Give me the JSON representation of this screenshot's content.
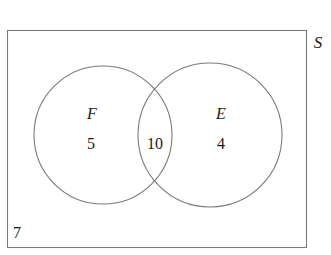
{
  "figure": {
    "type": "venn-diagram",
    "background_color": "#ffffff",
    "stroke_color": "#7a7a7a",
    "text_color": "#1a1a1a",
    "width": 331,
    "height": 255
  },
  "universe": {
    "label": "S",
    "label_position": {
      "x": 318,
      "y": 42
    },
    "outside_count": "7",
    "outside_count_position": {
      "x": 17,
      "y": 233
    },
    "rect": {
      "x": 7,
      "y": 30,
      "width": 300,
      "height": 218
    }
  },
  "sets": [
    {
      "name": "left-set",
      "label": "F",
      "label_position": {
        "x": 92,
        "y": 114
      },
      "count": "5",
      "count_position": {
        "x": 91,
        "y": 144
      },
      "circle": {
        "cx": 103,
        "cy": 135,
        "r": 69
      }
    },
    {
      "name": "right-set",
      "label": "E",
      "label_position": {
        "x": 221,
        "y": 114
      },
      "count": "4",
      "count_position": {
        "x": 221,
        "y": 144
      },
      "circle": {
        "cx": 210,
        "cy": 135,
        "r": 72
      }
    }
  ],
  "intersection": {
    "label": "",
    "count": "10",
    "count_position": {
      "x": 155,
      "y": 144
    }
  },
  "chart_data": {
    "type": "venn",
    "title": "",
    "universe_label": "S",
    "regions": [
      {
        "region": "F only",
        "label": "F",
        "value": 5
      },
      {
        "region": "F and E",
        "label": "10",
        "value": 10
      },
      {
        "region": "E only",
        "label": "E",
        "value": 4
      },
      {
        "region": "outside both",
        "label": "7",
        "value": 7
      }
    ],
    "total": 26,
    "set_labels": [
      "F",
      "E"
    ]
  }
}
